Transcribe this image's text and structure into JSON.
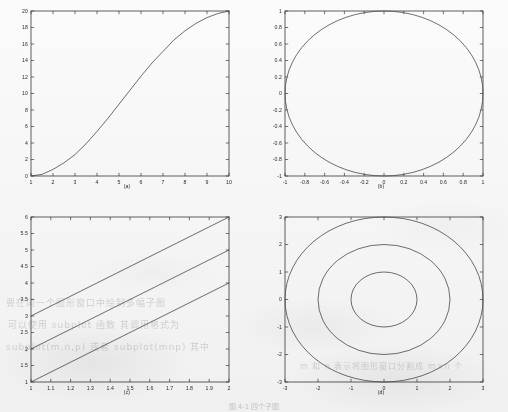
{
  "page": {
    "background_color": "#fbfbfb",
    "axis_color": "#3a3a3a",
    "curve_color": "#4a4a4a",
    "caption": "图 4-1 四个子图",
    "bleed_through": [
      "要在同一个图形窗口中绘制多幅子图",
      "可以使用 subplot 函数 其调用格式为",
      "subplot(m,n,p) 或者 subplot(mnp) 其中",
      "m 和 n 表示将图形窗口分割成 m×n 个"
    ]
  },
  "chart_data": [
    {
      "id": "a",
      "type": "line",
      "title": "",
      "label": "(a)",
      "xlabel": "",
      "ylabel": "",
      "xlim": [
        1,
        10
      ],
      "ylim": [
        0,
        20
      ],
      "xticks": [
        1,
        2,
        3,
        4,
        5,
        6,
        7,
        8,
        9,
        10
      ],
      "xticklabels": [
        "1",
        "2",
        "3",
        "4",
        "5",
        "6",
        "7",
        "8",
        "9",
        "10"
      ],
      "yticks": [
        0,
        2,
        4,
        6,
        8,
        10,
        12,
        14,
        16,
        18,
        20
      ],
      "yticklabels": [
        "0",
        "2",
        "4",
        "6",
        "8",
        "10",
        "12",
        "14",
        "16",
        "18",
        "20"
      ],
      "grid": false,
      "legend": null,
      "series": [
        {
          "name": "sigmoid-curve",
          "color": "#4a4a4a",
          "x": [
            1.0,
            1.5,
            2.0,
            2.5,
            3.0,
            3.5,
            4.0,
            4.5,
            5.0,
            5.5,
            6.0,
            6.5,
            7.0,
            7.5,
            8.0,
            8.5,
            9.0,
            9.5,
            10.0
          ],
          "y": [
            0.0,
            0.2,
            0.8,
            1.6,
            2.6,
            3.9,
            5.4,
            7.0,
            8.7,
            10.4,
            12.1,
            13.7,
            15.1,
            16.5,
            17.6,
            18.5,
            19.2,
            19.7,
            20.0
          ]
        }
      ]
    },
    {
      "id": "b",
      "type": "line",
      "title": "",
      "label": "(b)",
      "xlabel": "",
      "ylabel": "",
      "xlim": [
        -1,
        1
      ],
      "ylim": [
        -1,
        1
      ],
      "xticks": [
        -1,
        -0.8,
        -0.6,
        -0.4,
        -0.2,
        0,
        0.2,
        0.4,
        0.6,
        0.8,
        1
      ],
      "xticklabels": [
        "-1",
        "-0.8",
        "-0.6",
        "-0.4",
        "-0.2",
        "0",
        "0.2",
        "0.4",
        "0.6",
        "0.8",
        "1"
      ],
      "yticks": [
        -1,
        -0.8,
        -0.6,
        -0.4,
        -0.2,
        0,
        0.2,
        0.4,
        0.6,
        0.8,
        1
      ],
      "yticklabels": [
        "-1",
        "-0.8",
        "-0.6",
        "-0.4",
        "-0.2",
        "0",
        "0.2",
        "0.4",
        "0.6",
        "0.8",
        "1"
      ],
      "grid": false,
      "legend": null,
      "series": [
        {
          "name": "unit-circle",
          "color": "#4a4a4a",
          "shape": "circle",
          "cx": 0,
          "cy": 0,
          "r": 1
        }
      ]
    },
    {
      "id": "c",
      "type": "line",
      "title": "",
      "label": "(c)",
      "xlabel": "",
      "ylabel": "",
      "xlim": [
        1,
        2
      ],
      "ylim": [
        1,
        6
      ],
      "xticks": [
        1,
        1.1,
        1.2,
        1.3,
        1.4,
        1.5,
        1.6,
        1.7,
        1.8,
        1.9,
        2
      ],
      "xticklabels": [
        "1",
        "1.1",
        "1.2",
        "1.3",
        "1.4",
        "1.5",
        "1.6",
        "1.7",
        "1.8",
        "1.9",
        "2"
      ],
      "yticks": [
        1,
        1.5,
        2,
        2.5,
        3,
        3.5,
        4,
        4.5,
        5,
        5.5,
        6
      ],
      "yticklabels": [
        "1",
        "1.5",
        "2",
        "2.5",
        "3",
        "3.5",
        "4",
        "4.5",
        "5",
        "5.5",
        "6"
      ],
      "grid": false,
      "legend": null,
      "series": [
        {
          "name": "line-1",
          "color": "#4a4a4a",
          "x": [
            1,
            2
          ],
          "y": [
            1,
            4
          ]
        },
        {
          "name": "line-2",
          "color": "#4a4a4a",
          "x": [
            1,
            2
          ],
          "y": [
            2,
            5
          ]
        },
        {
          "name": "line-3",
          "color": "#4a4a4a",
          "x": [
            1,
            2
          ],
          "y": [
            3,
            6
          ]
        }
      ]
    },
    {
      "id": "d",
      "type": "line",
      "title": "",
      "label": "(d)",
      "xlabel": "",
      "ylabel": "",
      "xlim": [
        -3,
        3
      ],
      "ylim": [
        -3,
        3
      ],
      "xticks": [
        -3,
        -2,
        -1,
        0,
        1,
        2,
        3
      ],
      "xticklabels": [
        "-3",
        "-2",
        "-1",
        "0",
        "1",
        "2",
        "3"
      ],
      "yticks": [
        -3,
        -2,
        -1,
        0,
        1,
        2,
        3
      ],
      "yticklabels": [
        "-3",
        "-2",
        "-1",
        "0",
        "1",
        "2",
        "3"
      ],
      "grid": false,
      "legend": null,
      "series": [
        {
          "name": "circle-r1",
          "color": "#4a4a4a",
          "shape": "circle",
          "cx": 0,
          "cy": 0,
          "r": 1
        },
        {
          "name": "circle-r2",
          "color": "#4a4a4a",
          "shape": "circle",
          "cx": 0,
          "cy": 0,
          "r": 2
        },
        {
          "name": "circle-r3",
          "color": "#4a4a4a",
          "shape": "circle",
          "cx": 0,
          "cy": 0,
          "r": 3
        }
      ]
    }
  ]
}
